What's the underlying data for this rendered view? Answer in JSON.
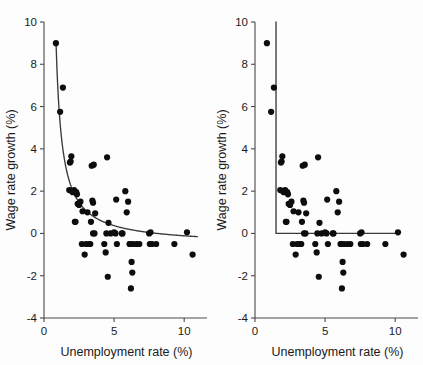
{
  "figure": {
    "background_color": "#fdfdfd",
    "marker_color": "#0d0d0d",
    "curve_color": "#3a3a3a",
    "axis_color": "#4a4a4a"
  },
  "chart_data": [
    {
      "type": "scatter",
      "panel_id": "left",
      "title": "",
      "xlabel": "Unemployment rate (%)",
      "ylabel": "Wage rate growth (%)",
      "xlim": [
        0,
        11.2
      ],
      "ylim": [
        -4,
        10
      ],
      "xticks": [
        0,
        5,
        10
      ],
      "xticklabels": [
        "0",
        "5",
        "10"
      ],
      "yticks": [
        -4,
        -2,
        0,
        2,
        4,
        6,
        8,
        10
      ],
      "yticklabels": [
        "-4",
        "-2",
        "0",
        "2",
        "4",
        "6",
        "8",
        "10"
      ],
      "grid": false,
      "legend": false,
      "x": [
        0.85,
        1.35,
        1.15,
        1.85,
        1.9,
        1.95,
        1.8,
        2.0,
        2.05,
        2.3,
        2.35,
        2.4,
        2.5,
        2.6,
        2.75,
        2.2,
        2.25,
        3.4,
        3.55,
        3.5,
        3.6,
        3.2,
        3.3,
        3.0,
        2.9,
        3.45,
        3.5,
        3.65,
        4.5,
        4.6,
        4.75,
        4.4,
        4.55,
        5.0,
        5.1,
        5.2,
        5.15,
        5.8,
        6.0,
        5.9,
        6.1,
        6.25,
        6.3,
        6.2,
        6.15,
        6.35,
        6.6,
        6.8,
        7.5,
        7.6,
        7.7,
        7.55,
        8.0,
        9.3,
        10.2,
        10.6,
        3.1,
        2.15,
        4.45,
        2.7,
        5.55,
        5.6,
        3.35,
        4.3
      ],
      "y": [
        9.0,
        6.9,
        5.75,
        3.35,
        3.4,
        3.65,
        2.05,
        2.0,
        1.95,
        1.95,
        1.85,
        1.4,
        1.35,
        1.5,
        1.05,
        0.55,
        0.55,
        3.2,
        3.25,
        0.0,
        0.0,
        -0.5,
        -0.5,
        -0.5,
        -1.0,
        1.55,
        1.45,
        0.95,
        3.6,
        0.5,
        0.0,
        -0.9,
        -2.05,
        0.05,
        0.0,
        -0.5,
        1.6,
        2.0,
        1.5,
        1.0,
        -0.5,
        -1.35,
        -1.85,
        -2.6,
        -0.5,
        -0.5,
        -0.5,
        -0.5,
        0.0,
        0.05,
        -0.5,
        -0.5,
        -0.5,
        -0.5,
        0.05,
        -1.0,
        1.0,
        2.05,
        0.0,
        -0.5,
        0.0,
        0.0,
        0.55,
        -0.5
      ],
      "fit": {
        "kind": "hyperbolic",
        "label": "nonlinear Phillips curve",
        "asymptote_y": -0.55
      }
    },
    {
      "type": "scatter",
      "panel_id": "right",
      "title": "",
      "xlabel": "Unemployment rate (%)",
      "ylabel": "Wage rate growth (%)",
      "xlim": [
        0,
        11.2
      ],
      "ylim": [
        -4,
        10
      ],
      "xticks": [
        0,
        5,
        10
      ],
      "xticklabels": [
        "0",
        "5",
        "10"
      ],
      "yticks": [
        -4,
        -2,
        0,
        2,
        4,
        6,
        8,
        10
      ],
      "yticklabels": [
        "-4",
        "-2",
        "0",
        "2",
        "4",
        "6",
        "8",
        "10"
      ],
      "grid": false,
      "legend": false,
      "x": [
        0.85,
        1.35,
        1.15,
        1.85,
        1.9,
        1.95,
        1.8,
        2.0,
        2.05,
        2.3,
        2.35,
        2.4,
        2.5,
        2.6,
        2.75,
        2.2,
        2.25,
        3.4,
        3.55,
        3.5,
        3.6,
        3.2,
        3.3,
        3.0,
        2.9,
        3.45,
        3.5,
        3.65,
        4.5,
        4.6,
        4.75,
        4.4,
        4.55,
        5.0,
        5.1,
        5.2,
        5.15,
        5.8,
        6.0,
        5.9,
        6.1,
        6.25,
        6.3,
        6.2,
        6.15,
        6.35,
        6.6,
        6.8,
        7.5,
        7.6,
        7.7,
        7.55,
        8.0,
        9.3,
        10.2,
        10.6,
        3.1,
        2.15,
        4.45,
        2.7,
        5.55,
        5.6,
        3.35,
        4.3
      ],
      "y": [
        9.0,
        6.9,
        5.75,
        3.35,
        3.4,
        3.65,
        2.05,
        2.0,
        1.95,
        1.95,
        1.85,
        1.4,
        1.35,
        1.5,
        1.05,
        0.55,
        0.55,
        3.2,
        3.25,
        0.0,
        0.0,
        -0.5,
        -0.5,
        -0.5,
        -1.0,
        1.55,
        1.45,
        0.95,
        3.6,
        0.5,
        0.0,
        -0.9,
        -2.05,
        0.05,
        0.0,
        -0.5,
        1.6,
        2.0,
        1.5,
        1.0,
        -0.5,
        -1.35,
        -1.85,
        -2.6,
        -0.5,
        -0.5,
        -0.5,
        -0.5,
        0.0,
        0.05,
        -0.5,
        -0.5,
        -0.5,
        -0.5,
        0.05,
        -1.0,
        1.0,
        2.05,
        0.0,
        -0.5,
        0.0,
        0.0,
        0.55,
        -0.5
      ],
      "fit": {
        "kind": "piecewise-elbow",
        "label": "kinked / L-shaped Phillips curve",
        "kink_x": 1.5,
        "floor_y": 0.0,
        "vertical_top_y": 10,
        "horizontal_end_x": 10.2
      }
    }
  ]
}
